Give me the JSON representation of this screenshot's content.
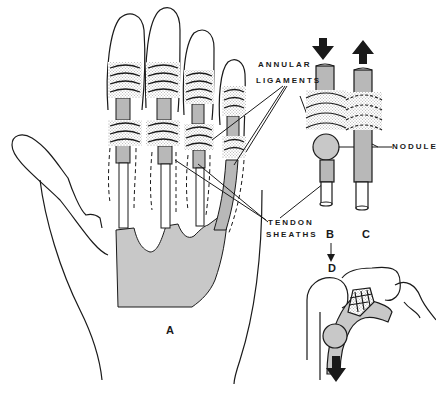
{
  "figure": {
    "colors": {
      "line": "#1a1a1a",
      "tendon_fill": "#b8b8b8",
      "palm_fill": "#c8c8c8",
      "ligament_stipple": "#d6d6d6",
      "background": "#ffffff"
    },
    "labels": {
      "annular_line1": "ANNULAR",
      "annular_line2": "LIGAMENTS",
      "tendon_line1": "TENDON",
      "tendon_line2": "SHEATHS",
      "nodule": "NODULE"
    },
    "panels": {
      "a": "A",
      "b": "B",
      "c": "C",
      "d": "D"
    },
    "arrows": {
      "b_direction": "down",
      "c_direction": "up",
      "b_to_d": "down",
      "d_direction": "down"
    }
  }
}
